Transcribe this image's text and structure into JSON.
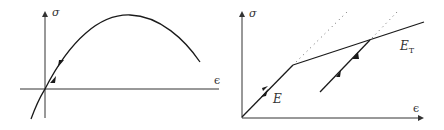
{
  "figure": {
    "left_panel": {
      "description": "Nonlinear stress-strain curve with loading/unloading along the same path",
      "y_axis_label": "σ",
      "x_axis_label": "ϵ"
    },
    "right_panel": {
      "description": "Bilinear elastic-plastic stress-strain with elastic unloading",
      "y_axis_label": "σ",
      "x_axis_label": "ϵ",
      "elastic_slope_label": "E",
      "tangent_slope_label_base": "E",
      "tangent_slope_label_sub": "T"
    },
    "colors": {
      "line": "#1a1a1a",
      "axis": "#333333",
      "dotted": "#666666"
    }
  }
}
